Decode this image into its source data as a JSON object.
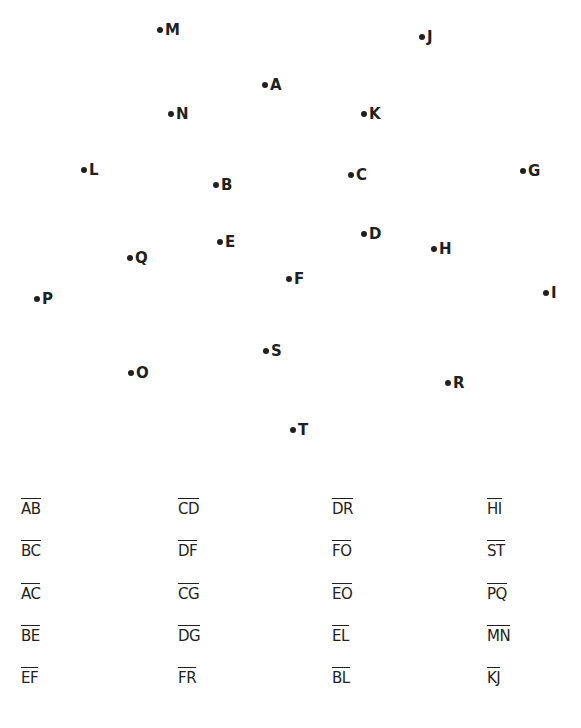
{
  "points": [
    {
      "label": "M",
      "x": 160,
      "y": 30
    },
    {
      "label": "J",
      "x": 422,
      "y": 37
    },
    {
      "label": "A",
      "x": 265,
      "y": 85
    },
    {
      "label": "N",
      "x": 171,
      "y": 114
    },
    {
      "label": "K",
      "x": 364,
      "y": 114
    },
    {
      "label": "L",
      "x": 84,
      "y": 170
    },
    {
      "label": "B",
      "x": 216,
      "y": 185
    },
    {
      "label": "C",
      "x": 351,
      "y": 175
    },
    {
      "label": "G",
      "x": 523,
      "y": 171
    },
    {
      "label": "D",
      "x": 364,
      "y": 234
    },
    {
      "label": "E",
      "x": 220,
      "y": 242
    },
    {
      "label": "H",
      "x": 434,
      "y": 249
    },
    {
      "label": "Q",
      "x": 130,
      "y": 258
    },
    {
      "label": "F",
      "x": 289,
      "y": 279
    },
    {
      "label": "P",
      "x": 37,
      "y": 299
    },
    {
      "label": "I",
      "x": 546,
      "y": 293
    },
    {
      "label": "S",
      "x": 266,
      "y": 351
    },
    {
      "label": "O",
      "x": 131,
      "y": 373
    },
    {
      "label": "R",
      "x": 448,
      "y": 383
    },
    {
      "label": "T",
      "x": 293,
      "y": 430
    }
  ],
  "segments": {
    "columns": [
      [
        "AB",
        "BC",
        "AC",
        "BE",
        "EF"
      ],
      [
        "CD",
        "DF",
        "CG",
        "DG",
        "FR"
      ],
      [
        "DR",
        "FO",
        "EO",
        "EL",
        "BL"
      ],
      [
        "HI",
        "ST",
        "PQ",
        "MN",
        "KJ"
      ]
    ]
  }
}
